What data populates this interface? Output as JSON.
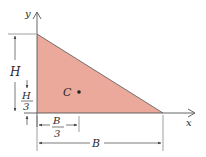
{
  "figure": {
    "type": "triangle-centroid",
    "colors": {
      "fill": "#eba99c",
      "stroke": "#3a3a3a",
      "dim": "#444444"
    },
    "axes": {
      "x_label": "x",
      "y_label": "y"
    },
    "centroid": {
      "label": "C"
    },
    "dimensions": {
      "height": "H",
      "height_third_num": "H",
      "height_third_den": "3",
      "base_third_num": "B",
      "base_third_den": "3",
      "base": "B"
    }
  }
}
